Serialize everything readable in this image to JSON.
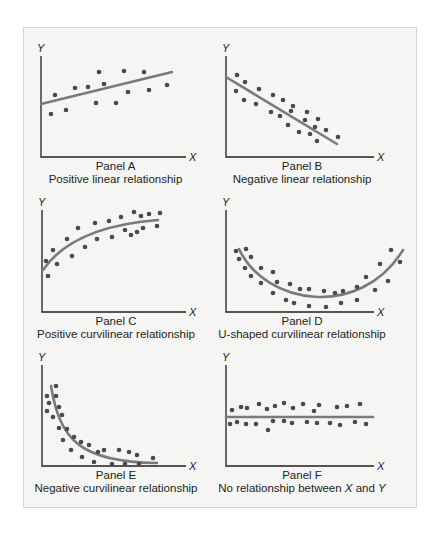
{
  "figure": {
    "frame_background": "#f5f5f4",
    "dot_color": "#4a4a4a",
    "fit_line_color": "#7a7a7a",
    "axis_color": "#231f20"
  },
  "chart_data": [
    {
      "type": "scatter",
      "title": "Panel A",
      "subtitle": "Positive linear relationship",
      "xlabel": "X",
      "ylabel": "Y",
      "fit": "linear-increasing",
      "axes": {
        "origin": [
          41,
          157
        ],
        "y_top": 56,
        "x_right": 186
      },
      "fit_path": "M41,104 L172,72",
      "points": [
        [
          51,
          114
        ],
        [
          55,
          95
        ],
        [
          66,
          110
        ],
        [
          75,
          88
        ],
        [
          88,
          87
        ],
        [
          99,
          72
        ],
        [
          96,
          103
        ],
        [
          104,
          84
        ],
        [
          116,
          103
        ],
        [
          124,
          71
        ],
        [
          128,
          92
        ],
        [
          144,
          72
        ],
        [
          149,
          90
        ],
        [
          167,
          85
        ]
      ]
    },
    {
      "type": "scatter",
      "title": "Panel B",
      "subtitle": "Negative linear relationship",
      "xlabel": "X",
      "ylabel": "Y",
      "fit": "linear-decreasing",
      "axes": {
        "origin": [
          226,
          157
        ],
        "y_top": 56,
        "x_right": 374
      },
      "fit_path": "M226,77 L337,144",
      "points": [
        [
          237,
          75
        ],
        [
          245,
          82
        ],
        [
          236,
          91
        ],
        [
          259,
          89
        ],
        [
          244,
          100
        ],
        [
          256,
          104
        ],
        [
          273,
          95
        ],
        [
          283,
          100
        ],
        [
          293,
          106
        ],
        [
          271,
          112
        ],
        [
          291,
          111
        ],
        [
          280,
          116
        ],
        [
          307,
          112
        ],
        [
          305,
          120
        ],
        [
          318,
          119
        ],
        [
          288,
          125
        ],
        [
          315,
          127
        ],
        [
          299,
          132
        ],
        [
          310,
          134
        ],
        [
          326,
          130
        ],
        [
          317,
          141
        ],
        [
          338,
          137
        ]
      ]
    },
    {
      "type": "scatter",
      "title": "Panel C",
      "subtitle": "Positive curvilinear relationship",
      "xlabel": "X",
      "ylabel": "Y",
      "fit": "positive-curvilinear",
      "axes": {
        "origin": [
          42,
          312
        ],
        "y_top": 210,
        "x_right": 186
      },
      "fit_path": "M43,270 C60,245 95,225 158,220",
      "points": [
        [
          46,
          261
        ],
        [
          48,
          276
        ],
        [
          53,
          250
        ],
        [
          57,
          264
        ],
        [
          67,
          239
        ],
        [
          72,
          256
        ],
        [
          78,
          228
        ],
        [
          85,
          247
        ],
        [
          95,
          223
        ],
        [
          97,
          239
        ],
        [
          109,
          221
        ],
        [
          112,
          237
        ],
        [
          121,
          217
        ],
        [
          125,
          230
        ],
        [
          131,
          235
        ],
        [
          134,
          212
        ],
        [
          137,
          232
        ],
        [
          141,
          216
        ],
        [
          143,
          228
        ],
        [
          149,
          214
        ],
        [
          157,
          226
        ],
        [
          160,
          213
        ]
      ]
    },
    {
      "type": "scatter",
      "title": "Panel D",
      "subtitle": "U-shaped curvilinear relationship",
      "xlabel": "X",
      "ylabel": "Y",
      "fit": "u-shaped",
      "axes": {
        "origin": [
          226,
          312
        ],
        "y_top": 210,
        "x_right": 374
      },
      "fit_path": "M239,249 C265,305 360,320 403,250",
      "points": [
        [
          236,
          251
        ],
        [
          246,
          249
        ],
        [
          239,
          259
        ],
        [
          251,
          257
        ],
        [
          245,
          268
        ],
        [
          261,
          268
        ],
        [
          251,
          276
        ],
        [
          273,
          272
        ],
        [
          261,
          283
        ],
        [
          277,
          282
        ],
        [
          273,
          293
        ],
        [
          290,
          284
        ],
        [
          300,
          289
        ],
        [
          309,
          289
        ],
        [
          286,
          300
        ],
        [
          294,
          303
        ],
        [
          324,
          291
        ],
        [
          335,
          293
        ],
        [
          343,
          291
        ],
        [
          309,
          306
        ],
        [
          326,
          307
        ],
        [
          341,
          303
        ],
        [
          357,
          287
        ],
        [
          366,
          277
        ],
        [
          357,
          300
        ],
        [
          375,
          290
        ],
        [
          388,
          281
        ],
        [
          380,
          264
        ],
        [
          391,
          250
        ],
        [
          400,
          262
        ]
      ]
    },
    {
      "type": "scatter",
      "title": "Panel E",
      "subtitle": "Negative curvilinear relationship",
      "xlabel": "X",
      "ylabel": "Y",
      "fit": "negative-curvilinear",
      "axes": {
        "origin": [
          42,
          466
        ],
        "y_top": 365,
        "x_right": 186
      },
      "fit_path": "M51,386 C60,440 80,462 157,463",
      "points": [
        [
          47,
          396
        ],
        [
          56,
          386
        ],
        [
          49,
          403
        ],
        [
          56,
          396
        ],
        [
          47,
          411
        ],
        [
          59,
          407
        ],
        [
          53,
          417
        ],
        [
          62,
          415
        ],
        [
          59,
          428
        ],
        [
          67,
          429
        ],
        [
          63,
          440
        ],
        [
          74,
          437
        ],
        [
          71,
          450
        ],
        [
          81,
          442
        ],
        [
          89,
          445
        ],
        [
          82,
          457
        ],
        [
          98,
          452
        ],
        [
          104,
          450
        ],
        [
          94,
          462
        ],
        [
          112,
          464
        ],
        [
          119,
          450
        ],
        [
          129,
          452
        ],
        [
          125,
          464
        ],
        [
          137,
          455
        ],
        [
          139,
          464
        ],
        [
          153,
          458
        ]
      ]
    },
    {
      "type": "scatter",
      "title": "Panel F",
      "subtitle": "No relationship between X and Y",
      "subtitle_parts": [
        "No relationship between ",
        "X",
        " and ",
        "Y"
      ],
      "xlabel": "X",
      "ylabel": "Y",
      "fit": "flat",
      "axes": {
        "origin": [
          226,
          466
        ],
        "y_top": 365,
        "x_right": 374
      },
      "fit_path": "M226,417 L373,417",
      "points": [
        [
          232,
          410
        ],
        [
          241,
          407
        ],
        [
          247,
          408
        ],
        [
          259,
          404
        ],
        [
          267,
          409
        ],
        [
          275,
          406
        ],
        [
          284,
          403
        ],
        [
          293,
          408
        ],
        [
          303,
          404
        ],
        [
          314,
          411
        ],
        [
          319,
          405
        ],
        [
          337,
          407
        ],
        [
          347,
          406
        ],
        [
          360,
          404
        ],
        [
          230,
          424
        ],
        [
          237,
          422
        ],
        [
          246,
          424
        ],
        [
          256,
          424
        ],
        [
          268,
          430
        ],
        [
          273,
          421
        ],
        [
          284,
          421
        ],
        [
          292,
          423
        ],
        [
          307,
          422
        ],
        [
          317,
          423
        ],
        [
          330,
          423
        ],
        [
          340,
          425
        ],
        [
          355,
          422
        ],
        [
          366,
          424
        ]
      ]
    }
  ]
}
